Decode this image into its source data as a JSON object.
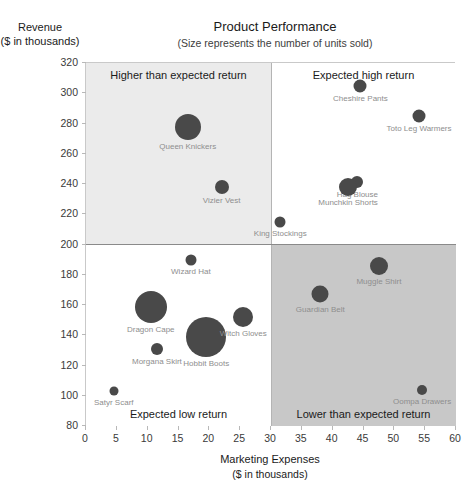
{
  "chart_data": {
    "type": "scatter",
    "title": "Product Performance",
    "subtitle": "(Size represents the number of units sold)",
    "xlabel": "Marketing Expenses",
    "xlabel_units": "($ in thousands)",
    "ylabel": "Revenue",
    "ylabel_units": "($ in thousands)",
    "xlim": [
      0,
      60
    ],
    "ylim": [
      80,
      320
    ],
    "xticks": [
      0,
      5,
      10,
      15,
      20,
      25,
      30,
      35,
      40,
      45,
      50,
      55,
      60
    ],
    "yticks": [
      80,
      100,
      120,
      140,
      160,
      180,
      200,
      220,
      240,
      260,
      280,
      300,
      320
    ],
    "grid": false,
    "legend": "none",
    "bubble_color": "#494949",
    "quadrant_split": {
      "x": 30,
      "y": 200
    },
    "quadrants": [
      {
        "id": "top-left",
        "label": "Higher than expected return",
        "color": "#ebebeb"
      },
      {
        "id": "top-right",
        "label": "Expected high return",
        "color": "#ffffff"
      },
      {
        "id": "bottom-left",
        "label": "Expected low return",
        "color": "#ffffff"
      },
      {
        "id": "bottom-right",
        "label": "Lower than expected return",
        "color": "#c8c8c8"
      }
    ],
    "points": [
      {
        "name": "Queen Knickers",
        "x": 16.5,
        "y": 278,
        "size": 26
      },
      {
        "name": "Vizier Vest",
        "x": 22.0,
        "y": 238,
        "size": 14
      },
      {
        "name": "Cheshire Pants",
        "x": 44.5,
        "y": 305,
        "size": 13
      },
      {
        "name": "Toto Leg Warmers",
        "x": 54.0,
        "y": 285,
        "size": 13
      },
      {
        "name": "Hag Blouse",
        "x": 44.0,
        "y": 241,
        "size": 12
      },
      {
        "name": "Munchkin Shorts",
        "x": 42.5,
        "y": 238,
        "size": 18
      },
      {
        "name": "King Stockings",
        "x": 31.5,
        "y": 215,
        "size": 11
      },
      {
        "name": "Wizard Hat",
        "x": 17.0,
        "y": 190,
        "size": 11
      },
      {
        "name": "Dragon Cape",
        "x": 10.5,
        "y": 159,
        "size": 32
      },
      {
        "name": "Morgana Skirt",
        "x": 11.5,
        "y": 131,
        "size": 12
      },
      {
        "name": "Hobbit Boots",
        "x": 19.5,
        "y": 139,
        "size": 40
      },
      {
        "name": "Witch Gloves",
        "x": 25.5,
        "y": 152,
        "size": 20
      },
      {
        "name": "Satyr Scarf",
        "x": 4.5,
        "y": 103,
        "size": 9
      },
      {
        "name": "Muggle Shirt",
        "x": 47.5,
        "y": 186,
        "size": 18
      },
      {
        "name": "Guardian Belt",
        "x": 38.0,
        "y": 167,
        "size": 17
      },
      {
        "name": "Oompa Drawers",
        "x": 54.5,
        "y": 104,
        "size": 10
      }
    ]
  }
}
